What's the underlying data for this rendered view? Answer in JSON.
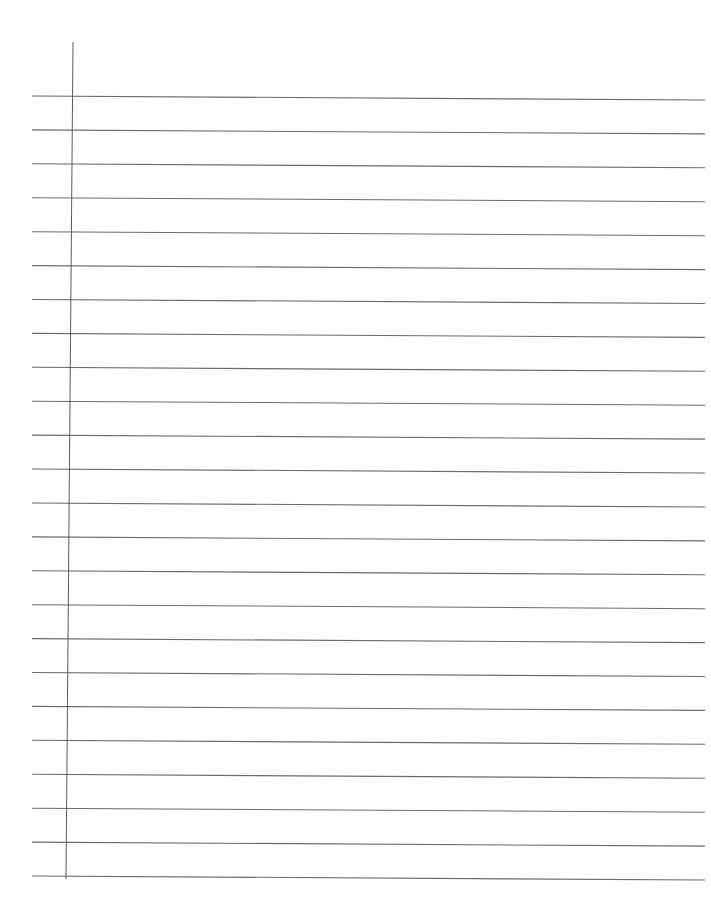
{
  "page": {
    "type": "blank-lined-paper",
    "background_color": "#ffffff",
    "rule_color": "#6a6a6a",
    "margin_color": "#5a5a5a",
    "line_count": 24
  },
  "rules": {
    "left_x": 32,
    "right_x": 705,
    "first_y_left": 96,
    "first_y_right": 100,
    "last_y_left": 876,
    "last_y_right": 880,
    "spacing": 33.9
  },
  "margin": {
    "top_x": 73,
    "top_y": 42,
    "bottom_x": 66,
    "bottom_y": 879
  }
}
